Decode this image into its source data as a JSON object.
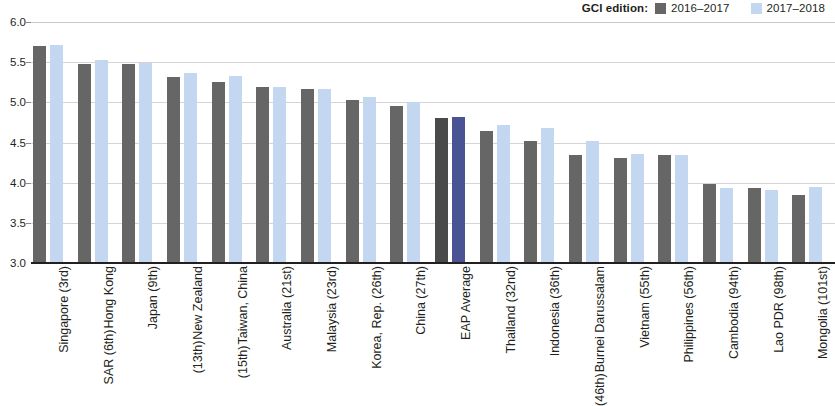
{
  "legend": {
    "title": "GCI edition:",
    "entries": [
      {
        "label": "2016–2017",
        "color": "#666666"
      },
      {
        "label": "2017–2018",
        "color": "#c3d7f0"
      }
    ]
  },
  "colors": {
    "prev": "#666666",
    "curr": "#c3d7f0",
    "prev_highlight": "#4a4a4a",
    "curr_highlight": "#4a5494",
    "gridline": "#d4d4d4",
    "axis": "#231f20"
  },
  "yaxis": {
    "ticks": [
      "6.0",
      "5.5",
      "5.0",
      "4.5",
      "4.0",
      "3.5",
      "3.0"
    ],
    "min": 3.0,
    "max": 6.0,
    "step": 0.5
  },
  "chart_data": {
    "type": "bar",
    "title": "",
    "xlabel": "",
    "ylabel": "",
    "ylim": [
      3.0,
      6.0
    ],
    "grid": true,
    "legend_position": "top-right",
    "categories": [
      "Singapore (3rd)",
      "Hong Kong SAR (6th)",
      "Japan (9th)",
      "New Zealand (13th)",
      "Taiwan, China (15th)",
      "Australia (21st)",
      "Malaysia (23rd)",
      "Korea, Rep. (26th)",
      "China (27th)",
      "EAP Average",
      "Thailand (32nd)",
      "Indonesia (36th)",
      "Burnei Darussalam (46th)",
      "Vietnam (55th)",
      "Philippines (56th)",
      "Cambodia (94th)",
      "Lao PDR (98th)",
      "Mongolia (101st)"
    ],
    "category_lines": [
      [
        "Singapore (3rd)"
      ],
      [
        "Hong Kong",
        "SAR (6th)"
      ],
      [
        "Japan (9th)"
      ],
      [
        "New Zealand",
        "(13th)"
      ],
      [
        "Taiwan, China",
        "(15th)"
      ],
      [
        "Australia (21st)"
      ],
      [
        "Malaysia (23rd)"
      ],
      [
        "Korea, Rep. (26th)"
      ],
      [
        "China (27th)"
      ],
      [
        "EAP Average"
      ],
      [
        "Thailand (32nd)"
      ],
      [
        "Indonesia (36th)"
      ],
      [
        "Burnei Darussalam",
        "(46th)"
      ],
      [
        "Vietnam (55th)"
      ],
      [
        "Philippines (56th)"
      ],
      [
        "Cambodia (94th)"
      ],
      [
        "Lao PDR (98th)"
      ],
      [
        "Mongolia (101st)"
      ]
    ],
    "highlight_index": 9,
    "series": [
      {
        "name": "2016–2017",
        "values": [
          5.7,
          5.48,
          5.48,
          5.31,
          5.25,
          5.19,
          5.16,
          5.03,
          4.95,
          4.8,
          4.64,
          4.52,
          4.35,
          4.31,
          4.35,
          3.98,
          3.93,
          3.85
        ]
      },
      {
        "name": "2017–2018",
        "values": [
          5.71,
          5.53,
          5.49,
          5.37,
          5.33,
          5.19,
          5.17,
          5.07,
          5.0,
          4.82,
          4.72,
          4.68,
          4.52,
          4.36,
          4.35,
          3.93,
          3.91,
          3.95
        ]
      }
    ]
  }
}
